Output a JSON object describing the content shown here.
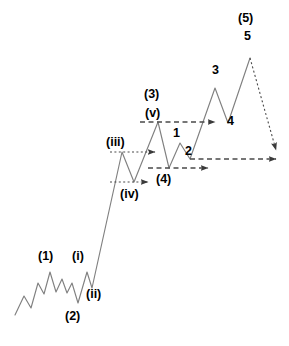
{
  "figure": {
    "type": "elliott-wave-diagram",
    "title": "",
    "background_color": "#ffffff",
    "line_color": "#808080",
    "label_color": "#000000",
    "projection_color": "#555555",
    "width": 289,
    "height": 346
  },
  "chart_data": {
    "type": "line",
    "title": "",
    "xlabel": "",
    "ylabel": "",
    "grid": false,
    "legend": null,
    "axis_visible": false,
    "series": [
      {
        "name": "price-path",
        "style": "solid",
        "points": [
          {
            "x": 15,
            "y": 315,
            "label": null
          },
          {
            "x": 24,
            "y": 296,
            "label": null
          },
          {
            "x": 31,
            "y": 308,
            "label": null
          },
          {
            "x": 38,
            "y": 283,
            "label": null
          },
          {
            "x": 44,
            "y": 294,
            "label": null
          },
          {
            "x": 50,
            "y": 272,
            "label": "(1)"
          },
          {
            "x": 56,
            "y": 292,
            "label": null
          },
          {
            "x": 62,
            "y": 279,
            "label": null
          },
          {
            "x": 67,
            "y": 293,
            "label": null
          },
          {
            "x": 72,
            "y": 283,
            "label": null
          },
          {
            "x": 78,
            "y": 303,
            "label": "(2)"
          },
          {
            "x": 87,
            "y": 272,
            "label": "(i)"
          },
          {
            "x": 92,
            "y": 288,
            "label": "(ii)"
          },
          {
            "x": 122,
            "y": 152,
            "label": "(iii)"
          },
          {
            "x": 134,
            "y": 182,
            "label": "(iv)"
          },
          {
            "x": 158,
            "y": 122,
            "label": "(3) (v)"
          },
          {
            "x": 169,
            "y": 168,
            "label": null
          },
          {
            "x": 180,
            "y": 143,
            "label": "1"
          },
          {
            "x": 190,
            "y": 159,
            "label": "2"
          },
          {
            "x": 215,
            "y": 88,
            "label": "3"
          },
          {
            "x": 228,
            "y": 123,
            "label": "4"
          },
          {
            "x": 250,
            "y": 58,
            "label": "5"
          }
        ]
      },
      {
        "name": "wave-5-projection",
        "style": "dotted",
        "points": [
          {
            "x": 250,
            "y": 58
          },
          {
            "x": 276,
            "y": 150
          }
        ]
      }
    ],
    "projection_arrows": [
      {
        "name": "iv-projection",
        "style": "dotted",
        "y": 182,
        "x_start": 110,
        "x_end": 148
      },
      {
        "name": "iii-projection",
        "style": "dotted",
        "y": 152,
        "x_start": 110,
        "x_end": 155
      },
      {
        "name": "v-projection",
        "style": "dashed",
        "y": 122,
        "x_start": 140,
        "x_end": 215
      },
      {
        "name": "four-projection",
        "style": "dashed",
        "y": 168,
        "x_start": 148,
        "x_end": 208
      },
      {
        "name": "two-projection",
        "style": "dashed",
        "y": 159,
        "x_start": 190,
        "x_end": 276
      }
    ]
  },
  "labels": [
    {
      "id": "label-wave-1",
      "text": "(1)",
      "degree": "primary",
      "x": 38,
      "y": 250
    },
    {
      "id": "label-wave-2",
      "text": "(2)",
      "degree": "primary",
      "x": 65,
      "y": 310
    },
    {
      "id": "label-wave-i",
      "text": "(i)",
      "degree": "minute",
      "x": 72,
      "y": 250
    },
    {
      "id": "label-wave-ii",
      "text": "(ii)",
      "degree": "minute",
      "x": 86,
      "y": 288
    },
    {
      "id": "label-wave-iii",
      "text": "(iii)",
      "degree": "minute",
      "x": 106,
      "y": 136
    },
    {
      "id": "label-wave-iv",
      "text": "(iv)",
      "degree": "minute",
      "x": 120,
      "y": 188
    },
    {
      "id": "label-wave-3",
      "text": "(3)",
      "degree": "primary",
      "x": 144,
      "y": 88
    },
    {
      "id": "label-wave-v",
      "text": "(v)",
      "degree": "minute",
      "x": 145,
      "y": 107
    },
    {
      "id": "label-wave-4",
      "text": "(4)",
      "degree": "primary",
      "x": 156,
      "y": 173
    },
    {
      "id": "label-minor-1",
      "text": "1",
      "degree": "minor",
      "x": 173,
      "y": 127
    },
    {
      "id": "label-minor-2",
      "text": "2",
      "degree": "minor",
      "x": 185,
      "y": 145
    },
    {
      "id": "label-minor-3",
      "text": "3",
      "degree": "minor",
      "x": 212,
      "y": 64
    },
    {
      "id": "label-minor-4",
      "text": "4",
      "degree": "minor",
      "x": 227,
      "y": 115
    },
    {
      "id": "label-wave-5",
      "text": "(5)",
      "degree": "primary",
      "x": 238,
      "y": 12
    },
    {
      "id": "label-minor-5",
      "text": "5",
      "degree": "minor",
      "x": 244,
      "y": 30
    }
  ]
}
